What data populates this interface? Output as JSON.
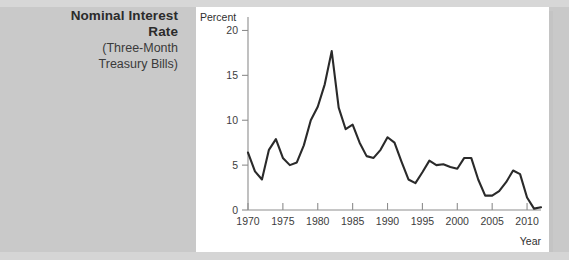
{
  "caption": {
    "title_line1": "Nominal Interest",
    "title_line2": "Rate",
    "sub_line1": "(Three-Month",
    "sub_line2": "Treasury Bills)"
  },
  "colors": {
    "page_background": "#c9c9c9",
    "panel_background": "#ffffff",
    "line_color": "#2a2a2a",
    "axis_color": "#8d8d8d",
    "text_color": "#2b2b2b"
  },
  "chart_data": {
    "type": "line",
    "title": "",
    "subtitle": "",
    "xlabel": "Year",
    "ylabel": "Percent",
    "xlim": [
      1970,
      2012
    ],
    "ylim": [
      0,
      21.5
    ],
    "grid": false,
    "legend": null,
    "xticks": [
      1970,
      1975,
      1980,
      1985,
      1990,
      1995,
      2000,
      2005,
      2010
    ],
    "xtick_labels": [
      "1970",
      "1975",
      "1980",
      "1985",
      "1990",
      "1995",
      "2000",
      "2005",
      "2010"
    ],
    "yticks": [
      0,
      5,
      10,
      15,
      20
    ],
    "ytick_labels": [
      "0",
      "5",
      "10",
      "15",
      "20"
    ],
    "series": [
      {
        "name": "Nominal Interest Rate (Three-Month Treasury Bills)",
        "x": [
          1970,
          1971,
          1972,
          1973,
          1974,
          1975,
          1976,
          1977,
          1978,
          1979,
          1980,
          1981,
          1982,
          1983,
          1984,
          1985,
          1986,
          1987,
          1988,
          1989,
          1990,
          1991,
          1992,
          1993,
          1994,
          1995,
          1996,
          1997,
          1998,
          1999,
          2000,
          2001,
          2002,
          2003,
          2004,
          2005,
          2006,
          2007,
          2008,
          2009,
          2010,
          2011,
          2012
        ],
        "values": [
          6.4,
          4.3,
          3.4,
          6.7,
          7.9,
          5.8,
          5.0,
          5.3,
          7.2,
          10.0,
          11.5,
          14.0,
          17.7,
          11.4,
          9.0,
          9.5,
          7.5,
          6.0,
          5.8,
          6.7,
          8.1,
          7.5,
          5.4,
          3.4,
          3.0,
          4.2,
          5.5,
          5.0,
          5.1,
          4.8,
          4.6,
          5.8,
          5.8,
          3.4,
          1.6,
          1.6,
          2.1,
          3.1,
          4.4,
          4.0,
          1.4,
          0.15,
          0.3
        ]
      }
    ]
  }
}
